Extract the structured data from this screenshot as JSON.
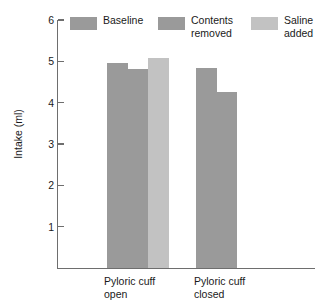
{
  "chart_data": {
    "type": "bar",
    "title": "",
    "subtitle": "",
    "xlabel": "",
    "ylabel": "Intake (ml)",
    "categories": [
      "Pyloric cuff\nopen",
      "Pyloric cuff\nclosed"
    ],
    "series": [
      {
        "name": "Baseline",
        "values": [
          4.95,
          4.84
        ],
        "color": "#9a9a9a"
      },
      {
        "name": "Contents\nremoved",
        "values": [
          4.82,
          4.25
        ],
        "color": "#9a9a9a"
      },
      {
        "name": "Saline\nadded",
        "values": [
          5.07,
          null
        ],
        "color": "#c2c2c2"
      }
    ],
    "ylim": [
      0,
      6
    ],
    "yticks": [
      6,
      5,
      4,
      3,
      2,
      1
    ],
    "ytick_labels": [
      "6",
      "5",
      "4",
      "3",
      "2",
      "1"
    ],
    "grid": false,
    "legend_position": "top",
    "axis_color": "#6e6e6e"
  },
  "legend": {
    "entries": [
      {
        "label": "Baseline"
      },
      {
        "label": "Contents\nremoved"
      },
      {
        "label": "Saline\nadded"
      }
    ]
  },
  "axes": {
    "y_title": "Intake (ml)",
    "y_tick_labels": [
      "6",
      "5",
      "4",
      "3",
      "2",
      "1"
    ],
    "x_tick_labels": [
      "Pyloric cuff\nopen",
      "Pyloric cuff\nclosed"
    ]
  }
}
